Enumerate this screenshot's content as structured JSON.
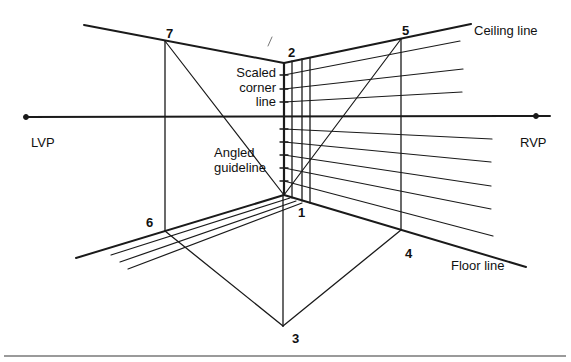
{
  "diagram": {
    "type": "two-point perspective construction",
    "labels": {
      "lvp": "LVP",
      "rvp": "RVP",
      "ceiling_line": "Ceiling line",
      "floor_line": "Floor line",
      "scaled_corner_line": [
        "Scaled",
        "corner",
        "line"
      ],
      "angled_guideline": [
        "Angled",
        "guideline"
      ]
    },
    "points": [
      {
        "id": "1",
        "label": "1"
      },
      {
        "id": "2",
        "label": "2"
      },
      {
        "id": "3",
        "label": "3"
      },
      {
        "id": "4",
        "label": "4"
      },
      {
        "id": "5",
        "label": "5"
      },
      {
        "id": "6",
        "label": "6"
      },
      {
        "id": "7",
        "label": "7"
      }
    ],
    "colors": {
      "line": "#1a1a1a",
      "background": "#ffffff",
      "bottom_rule": "#9a9a9a"
    }
  }
}
